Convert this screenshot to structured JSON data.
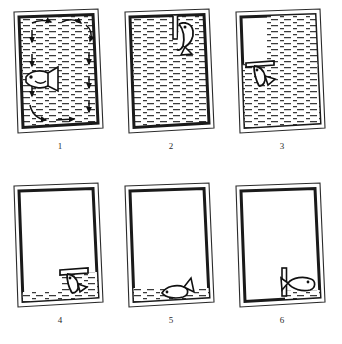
{
  "figure": {
    "style": "line-drawing",
    "ink_color": "#1a1a1a",
    "paper_color": "#ffffff",
    "water_hatch_color": "#3a3a3a",
    "panel_count": 6,
    "grid": {
      "columns": 3,
      "rows": 2
    }
  },
  "panels": [
    {
      "label": "1",
      "name": "panel-full-tank-circulation",
      "water_level_percent": 100,
      "water_region": "full",
      "fish": {
        "present": true,
        "position": "mid-left",
        "orientation": "facing-left",
        "pose": "swimming"
      },
      "arrows": {
        "present": true,
        "count": 10,
        "description": "clockwise circulation arrows around tank interior"
      },
      "divider": {
        "present": false
      }
    },
    {
      "label": "2",
      "name": "panel-full-tank-diving-fish",
      "water_level_percent": 97,
      "water_region": "full",
      "fish": {
        "present": true,
        "position": "top-right",
        "orientation": "head-down",
        "pose": "diving"
      },
      "arrows": {
        "present": false
      },
      "divider": {
        "present": true,
        "type": "vertical-post",
        "position": "top-center-right"
      }
    },
    {
      "label": "3",
      "name": "panel-right-half-water",
      "water_level_percent": 72,
      "water_region": "right-column-plus-lower",
      "fish": {
        "present": true,
        "position": "mid-left",
        "orientation": "head-down",
        "pose": "descending-under-ledge"
      },
      "arrows": {
        "present": false
      },
      "divider": {
        "present": true,
        "type": "horizontal-ledge",
        "position": "mid-left"
      }
    },
    {
      "label": "4",
      "name": "panel-low-water-right-pocket",
      "water_level_percent": 22,
      "water_region": "bottom-strip-and-right-pocket",
      "fish": {
        "present": true,
        "position": "lower-right",
        "orientation": "head-down",
        "pose": "under-ledge"
      },
      "arrows": {
        "present": false
      },
      "divider": {
        "present": true,
        "type": "horizontal-ledge",
        "position": "lower-right"
      }
    },
    {
      "label": "5",
      "name": "panel-shallow-water-fish-on-floor",
      "water_level_percent": 8,
      "water_region": "bottom-strip",
      "fish": {
        "present": true,
        "position": "bottom-center-right",
        "orientation": "facing-left",
        "pose": "lying-on-bottom"
      },
      "arrows": {
        "present": false
      },
      "divider": {
        "present": false
      }
    },
    {
      "label": "6",
      "name": "panel-empty-tank-fish-behind-post",
      "water_level_percent": 4,
      "water_region": "bottom-right-corner",
      "fish": {
        "present": true,
        "position": "bottom-right",
        "orientation": "facing-right",
        "pose": "resting"
      },
      "arrows": {
        "present": false
      },
      "divider": {
        "present": true,
        "type": "vertical-post",
        "position": "bottom-right"
      }
    }
  ]
}
